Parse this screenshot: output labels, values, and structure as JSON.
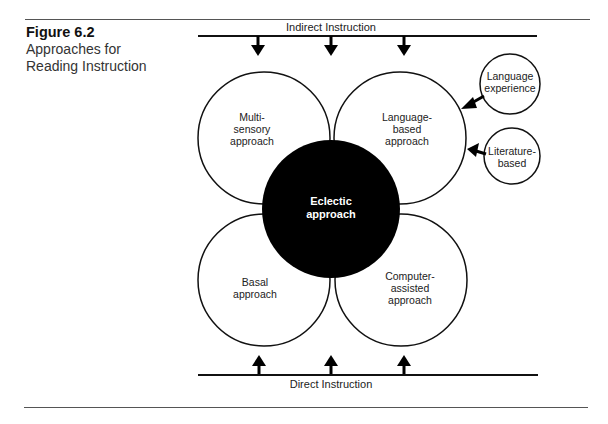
{
  "figure": {
    "number": "Figure 6.2",
    "title_line1": "Approaches for",
    "title_line2": "Reading Instruction"
  },
  "diagram": {
    "top_band": {
      "label": "Indirect Instruction",
      "arrow_direction": "down",
      "arrow_count": 3
    },
    "bottom_band": {
      "label": "Direct Instruction",
      "arrow_direction": "up",
      "arrow_count": 3
    },
    "center": {
      "line1": "Eclectic",
      "line2": "approach",
      "fill": "#000000"
    },
    "approaches": [
      {
        "position": "top-left",
        "lines": [
          "Multi-",
          "sensory",
          "approach"
        ]
      },
      {
        "position": "top-right",
        "lines": [
          "Language-",
          "based",
          "approach"
        ]
      },
      {
        "position": "bottom-left",
        "lines": [
          "Basal",
          "approach"
        ]
      },
      {
        "position": "bottom-right",
        "lines": [
          "Computer-",
          "assisted",
          "approach"
        ]
      }
    ],
    "satellites": [
      {
        "target": "top-right",
        "lines": [
          "Language",
          "experience"
        ]
      },
      {
        "target": "top-right",
        "lines": [
          "Literature-",
          "based"
        ]
      }
    ]
  }
}
